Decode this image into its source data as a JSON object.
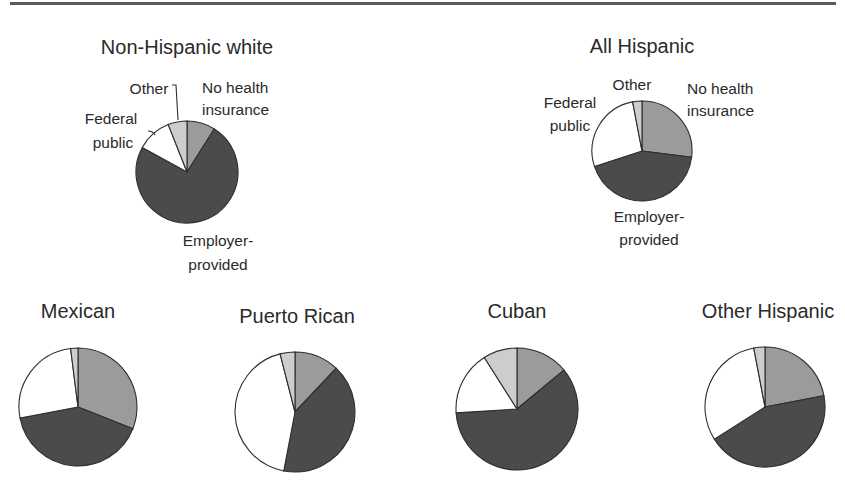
{
  "colors": {
    "no_health_insurance": "#9b9b9b",
    "employer_provided": "#4b4b4b",
    "federal_public": "#ffffff",
    "other": "#cdcdcd"
  },
  "chart_data": [
    {
      "type": "pie",
      "title": "Non-Hispanic white",
      "categories": [
        "No health insurance",
        "Employer-provided",
        "Federal public",
        "Other"
      ],
      "values": [
        9,
        74,
        11,
        6
      ],
      "start_angle": "12 o'clock, clockwise",
      "labels_shown": true
    },
    {
      "type": "pie",
      "title": "All Hispanic",
      "categories": [
        "No health insurance",
        "Employer-provided",
        "Federal public",
        "Other"
      ],
      "values": [
        27,
        43,
        27,
        3
      ],
      "start_angle": "12 o'clock, clockwise",
      "labels_shown": true
    },
    {
      "type": "pie",
      "title": "Mexican",
      "categories": [
        "No health insurance",
        "Employer-provided",
        "Federal public",
        "Other"
      ],
      "values": [
        31,
        41,
        26,
        2
      ],
      "start_angle": "12 o'clock, clockwise",
      "labels_shown": false
    },
    {
      "type": "pie",
      "title": "Puerto Rican",
      "categories": [
        "No health insurance",
        "Employer-provided",
        "Federal public",
        "Other"
      ],
      "values": [
        12,
        41,
        43,
        4
      ],
      "start_angle": "12 o'clock, clockwise",
      "labels_shown": false
    },
    {
      "type": "pie",
      "title": "Cuban",
      "categories": [
        "No health insurance",
        "Employer-provided",
        "Federal public",
        "Other"
      ],
      "values": [
        14,
        60,
        17,
        9
      ],
      "start_angle": "12 o'clock, clockwise",
      "labels_shown": false
    },
    {
      "type": "pie",
      "title": "Other Hispanic",
      "categories": [
        "No health insurance",
        "Employer-provided",
        "Federal public",
        "Other"
      ],
      "values": [
        22,
        44,
        31,
        3
      ],
      "start_angle": "12 o'clock, clockwise",
      "labels_shown": false
    }
  ],
  "labels": {
    "no_health": [
      "No health",
      "insurance"
    ],
    "employer": [
      "Employer-",
      "provided"
    ],
    "federal": [
      "Federal",
      "public"
    ],
    "other": "Other"
  }
}
